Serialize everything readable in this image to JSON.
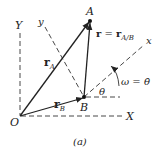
{
  "figure": {
    "caption": "(a)",
    "axes": {
      "fixed_y": "Y",
      "fixed_x": "X",
      "origin": "O",
      "rotating_y": "y",
      "rotating_x": "x"
    },
    "points": {
      "A": "A",
      "B": "B"
    },
    "vectors": {
      "rA": {
        "main": "r",
        "sub": "A"
      },
      "rB": {
        "main": "r",
        "sub": "B"
      },
      "relative": {
        "lhs": "r",
        "eq": " = ",
        "main": "r",
        "sub": "A/B"
      }
    },
    "angle": "θ",
    "angular_velocity": {
      "lhs": "ω",
      "eq": " = ",
      "rhs": "θ̇"
    },
    "colors": {
      "ink": "#222222",
      "background": "#ffffff"
    }
  }
}
